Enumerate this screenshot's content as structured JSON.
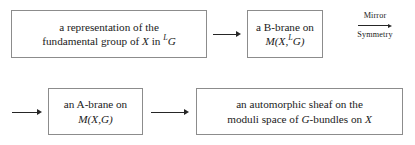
{
  "diagram": {
    "boxes": [
      {
        "id": "representation",
        "line1": "a representation of the",
        "line2_pre": "fundamental group of ",
        "line2_var1": "X",
        "line2_mid": " in ",
        "line2_sup": "L",
        "line2_var2": "G"
      },
      {
        "id": "b-brane",
        "line1": "a B-brane on",
        "line2_pre": "M(",
        "line2_var1": "X",
        "line2_mid": ",",
        "line2_sup": "L",
        "line2_var2": "G",
        "line2_post": ")"
      },
      {
        "id": "a-brane",
        "line1": "an A-brane on",
        "line2_pre": "M(",
        "line2_var1": "X",
        "line2_mid": ",",
        "line2_var2": "G",
        "line2_post": ")"
      },
      {
        "id": "automorphic-sheaf",
        "line1": "an automorphic sheaf on the",
        "line2_pre": "moduli space of ",
        "line2_var1": "G",
        "line2_mid": "-bundles on ",
        "line2_var2": "X"
      }
    ],
    "arrows": {
      "representation_to_bbrane": "→",
      "into_abrane": "→",
      "abrane_to_sheaf": "→",
      "mirror_label_top": "Mirror",
      "mirror_label_bottom": "Symmetry",
      "mirror_glyph": "→"
    },
    "colors": {
      "box_border": "#8c8c8c",
      "text": "#1a1a1a",
      "arrow": "#262626",
      "background": "#ffffff"
    }
  }
}
